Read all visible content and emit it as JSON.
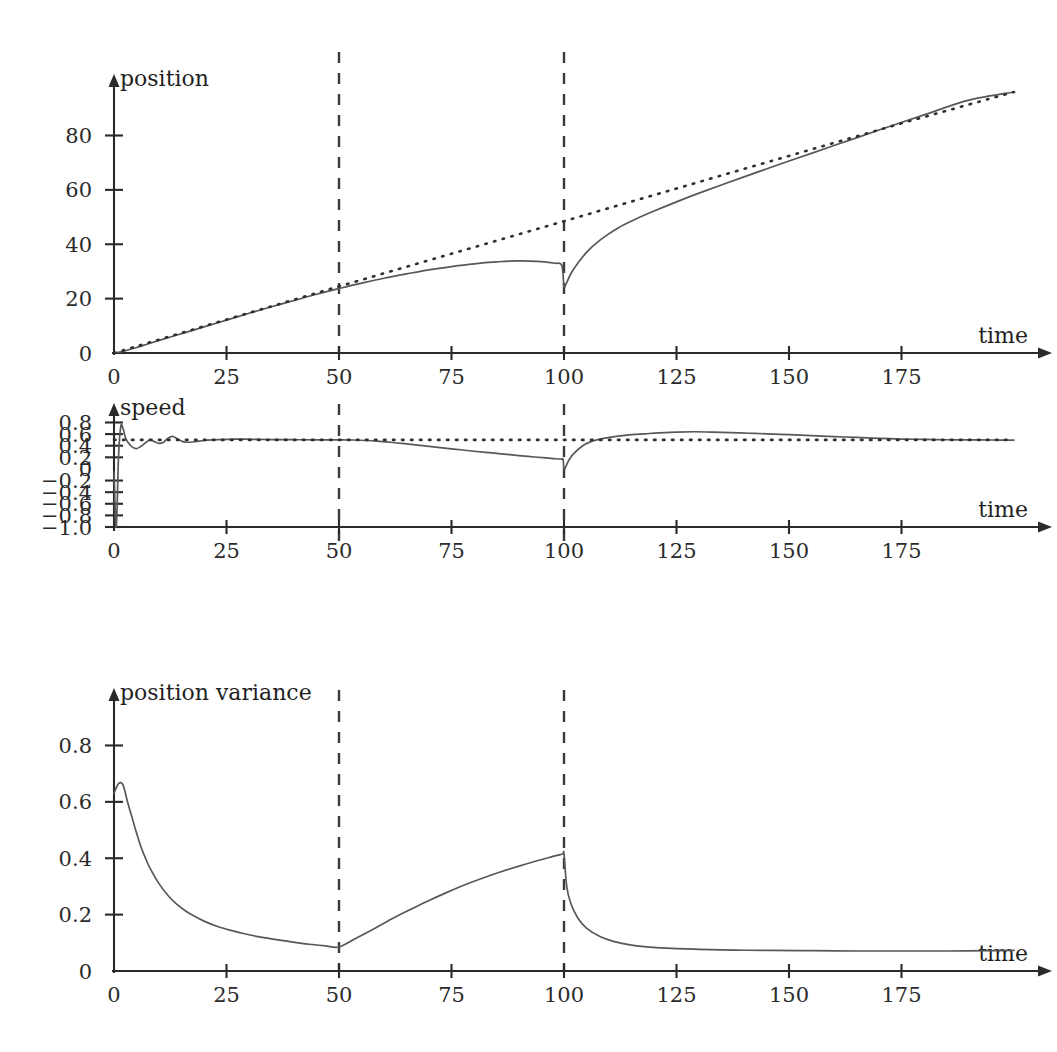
{
  "figure": {
    "title": "",
    "background": "#ffffff",
    "width": 1057,
    "height": 1052,
    "curve_color": "#585858",
    "reference_color": "#2f2f2f",
    "event_line_color": "#3a3a3a"
  },
  "panels": [
    {
      "id": "position",
      "axis_label_y": "position",
      "axis_label_x": "time",
      "x_ticks": [
        0,
        25,
        50,
        75,
        100,
        125,
        150,
        175
      ],
      "x_tick_labels": [
        "0",
        "25",
        "50",
        "75",
        "100",
        "125",
        "150",
        "175"
      ],
      "y_ticks": [
        0,
        20,
        40,
        60,
        80
      ],
      "y_tick_labels": [
        "0",
        "20",
        "40",
        "60",
        "80"
      ],
      "xlim": [
        0,
        200
      ],
      "ylim": [
        0,
        96
      ],
      "event_times": [
        50,
        100
      ]
    },
    {
      "id": "speed",
      "axis_label_y": "speed",
      "axis_label_x": "time",
      "x_ticks": [
        0,
        25,
        50,
        75,
        100,
        125,
        150,
        175
      ],
      "x_tick_labels": [
        "0",
        "25",
        "50",
        "75",
        "100",
        "125",
        "150",
        "175"
      ],
      "y_ticks": [
        0.8,
        0.6,
        0.4,
        0.2,
        0,
        -0.2,
        -0.4,
        -0.6,
        -0.8,
        -1.0
      ],
      "y_tick_labels": [
        "0.8",
        "0.6",
        "0.4",
        "0.2",
        "0",
        "−0.2",
        "−0.4",
        "−0.6",
        "−0.8",
        "−1.0"
      ],
      "xlim": [
        0,
        200
      ],
      "ylim": [
        -1.0,
        0.86
      ],
      "event_times": [
        50,
        100
      ]
    },
    {
      "id": "position-variance",
      "axis_label_y": "position variance",
      "axis_label_x": "time",
      "x_ticks": [
        0,
        25,
        50,
        75,
        100,
        125,
        150,
        175
      ],
      "x_tick_labels": [
        "0",
        "25",
        "50",
        "75",
        "100",
        "125",
        "150",
        "175"
      ],
      "y_ticks": [
        0,
        0.2,
        0.4,
        0.6,
        0.8
      ],
      "y_tick_labels": [
        "0",
        "0.2",
        "0.4",
        "0.6",
        "0.8"
      ],
      "xlim": [
        0,
        200
      ],
      "ylim": [
        0,
        0.94
      ],
      "event_times": [
        50,
        100
      ]
    }
  ],
  "chart_data": [
    {
      "type": "line",
      "id": "position",
      "title": "",
      "xlabel": "time",
      "ylabel": "position",
      "xlim": [
        0,
        200
      ],
      "ylim": [
        0,
        96
      ],
      "grid": false,
      "legend": "none",
      "annotations": [
        {
          "type": "vertical-dashed-line",
          "x": 50
        },
        {
          "type": "vertical-dashed-line",
          "x": 100
        }
      ],
      "series": [
        {
          "name": "estimated position",
          "style": "solid",
          "x": [
            0,
            2,
            5,
            8,
            12,
            16,
            20,
            25,
            30,
            35,
            40,
            45,
            50,
            55,
            60,
            65,
            70,
            75,
            80,
            85,
            90,
            95,
            98,
            99.5,
            100,
            100.5,
            102,
            105,
            108,
            112,
            116,
            120,
            125,
            130,
            140,
            150,
            160,
            170,
            180,
            190,
            200
          ],
          "y": [
            0,
            0.6,
            2.0,
            3.6,
            5.6,
            7.6,
            9.6,
            12.1,
            14.6,
            17.0,
            19.3,
            21.6,
            23.7,
            25.7,
            27.5,
            29.1,
            30.6,
            31.8,
            32.8,
            33.5,
            33.9,
            33.6,
            33.0,
            32.3,
            24.5,
            25.6,
            30.5,
            37.0,
            41.5,
            46.0,
            49.3,
            52.2,
            55.6,
            58.8,
            64.8,
            70.6,
            76.3,
            82.0,
            87.6,
            93.0,
            96.0
          ]
        },
        {
          "name": "true position",
          "style": "dotted",
          "x": [
            0,
            25,
            50,
            75,
            100,
            125,
            150,
            175,
            200
          ],
          "y": [
            0,
            12.3,
            24.5,
            36.5,
            48.5,
            60.5,
            72.5,
            84.5,
            96.0
          ]
        }
      ]
    },
    {
      "type": "line",
      "id": "speed",
      "title": "",
      "xlabel": "time",
      "ylabel": "speed",
      "xlim": [
        0,
        200
      ],
      "ylim": [
        -1.0,
        0.86
      ],
      "grid": false,
      "legend": "none",
      "annotations": [
        {
          "type": "vertical-dashed-line",
          "x": 50
        },
        {
          "type": "vertical-dashed-line",
          "x": 100
        }
      ],
      "series": [
        {
          "name": "estimated speed",
          "style": "solid",
          "x": [
            0,
            0.5,
            1,
            1.5,
            2,
            2.5,
            3,
            3.5,
            4,
            5,
            6,
            7,
            8,
            9,
            10,
            11,
            12,
            13,
            14,
            15,
            16,
            18,
            20,
            22,
            24,
            26,
            28,
            30,
            32,
            35,
            38,
            41,
            44,
            47,
            50,
            53,
            56,
            59,
            62,
            65,
            68,
            71,
            74,
            77,
            80,
            84,
            88,
            92,
            96,
            98,
            99.4,
            99.8,
            100,
            100.4,
            101,
            102,
            104,
            106,
            109,
            112,
            115,
            118,
            121,
            125,
            129,
            133,
            137,
            141,
            145,
            150,
            155,
            160,
            165,
            170,
            175,
            180,
            185,
            190,
            195,
            200
          ],
          "y": [
            -0.05,
            -1.0,
            0.2,
            0.73,
            0.7,
            0.55,
            0.47,
            0.42,
            0.38,
            0.35,
            0.39,
            0.45,
            0.5,
            0.47,
            0.44,
            0.46,
            0.53,
            0.56,
            0.52,
            0.48,
            0.46,
            0.47,
            0.49,
            0.5,
            0.505,
            0.51,
            0.515,
            0.51,
            0.508,
            0.506,
            0.504,
            0.503,
            0.502,
            0.501,
            0.5,
            0.498,
            0.49,
            0.475,
            0.455,
            0.43,
            0.405,
            0.38,
            0.355,
            0.33,
            0.305,
            0.275,
            0.245,
            0.215,
            0.19,
            0.175,
            0.17,
            0.165,
            0.0,
            0.04,
            0.14,
            0.25,
            0.39,
            0.47,
            0.53,
            0.565,
            0.59,
            0.605,
            0.62,
            0.635,
            0.64,
            0.635,
            0.625,
            0.615,
            0.605,
            0.59,
            0.575,
            0.558,
            0.543,
            0.528,
            0.515,
            0.508,
            0.503,
            0.5,
            0.498,
            0.497
          ]
        },
        {
          "name": "true speed",
          "style": "dotted",
          "x": [
            0,
            200
          ],
          "y": [
            0.5,
            0.5
          ]
        }
      ]
    },
    {
      "type": "line",
      "id": "position-variance",
      "title": "",
      "xlabel": "time",
      "ylabel": "position variance",
      "xlim": [
        0,
        200
      ],
      "ylim": [
        0,
        0.94
      ],
      "grid": false,
      "legend": "none",
      "annotations": [
        {
          "type": "vertical-dashed-line",
          "x": 50
        },
        {
          "type": "vertical-dashed-line",
          "x": 100
        }
      ],
      "series": [
        {
          "name": "position variance",
          "style": "solid",
          "x": [
            0,
            1,
            2,
            3,
            4,
            5,
            6,
            7,
            8,
            10,
            12,
            14,
            16,
            18,
            20,
            23,
            26,
            29,
            32,
            35,
            38,
            41,
            44,
            47,
            50,
            54,
            58,
            62,
            66,
            70,
            74,
            78,
            82,
            86,
            90,
            94,
            97,
            99,
            99.8,
            100,
            100.6,
            101.5,
            103,
            105,
            108,
            111,
            115,
            119,
            124,
            130,
            138,
            146,
            155,
            165,
            175,
            185,
            195,
            200
          ],
          "y": [
            0.63,
            0.665,
            0.66,
            0.6,
            0.545,
            0.49,
            0.44,
            0.4,
            0.365,
            0.31,
            0.268,
            0.236,
            0.212,
            0.193,
            0.177,
            0.158,
            0.144,
            0.132,
            0.122,
            0.114,
            0.107,
            0.1,
            0.094,
            0.089,
            0.085,
            0.118,
            0.152,
            0.187,
            0.219,
            0.25,
            0.279,
            0.306,
            0.33,
            0.352,
            0.372,
            0.391,
            0.404,
            0.412,
            0.416,
            0.416,
            0.3,
            0.24,
            0.19,
            0.152,
            0.122,
            0.105,
            0.092,
            0.085,
            0.08,
            0.077,
            0.074,
            0.073,
            0.072,
            0.071,
            0.071,
            0.071,
            0.072,
            0.073
          ]
        }
      ]
    }
  ]
}
